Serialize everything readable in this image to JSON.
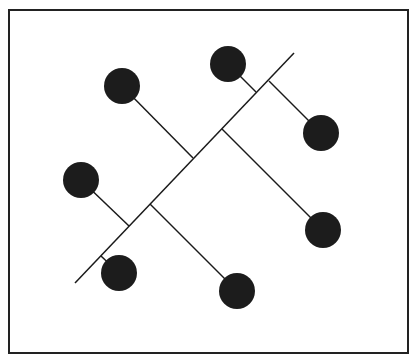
{
  "diagram": {
    "frame": {
      "x": 9,
      "y": 10,
      "width": 399,
      "height": 343,
      "stroke": "#222222"
    },
    "stroke_color": "#1a1a1a",
    "node_color": "#1c1c1c",
    "node_radius": 18,
    "main_axis": {
      "x1": 75,
      "y1": 283,
      "x2": 294,
      "y2": 53
    },
    "nodes": [
      {
        "id": "n1",
        "cx": 122,
        "cy": 86,
        "jx": 193,
        "jy": 158
      },
      {
        "id": "n2",
        "cx": 228,
        "cy": 64,
        "jx": 256,
        "jy": 92
      },
      {
        "id": "n3",
        "cx": 321,
        "cy": 133,
        "jx": 269,
        "jy": 81
      },
      {
        "id": "n4",
        "cx": 81,
        "cy": 180,
        "jx": 129,
        "jy": 226
      },
      {
        "id": "n5",
        "cx": 323,
        "cy": 230,
        "jx": 222,
        "jy": 129
      },
      {
        "id": "n6",
        "cx": 119,
        "cy": 273,
        "jx": 101,
        "jy": 256
      },
      {
        "id": "n7",
        "cx": 237,
        "cy": 291,
        "jx": 150,
        "jy": 204
      }
    ]
  }
}
